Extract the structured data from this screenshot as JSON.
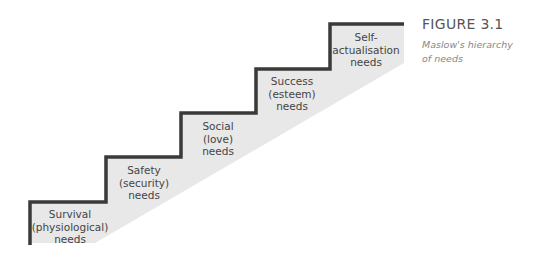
{
  "figure": {
    "title": "FIGURE 3.1",
    "caption_line1": "Maslow's hierarchy",
    "caption_line2": "of needs"
  },
  "steps": [
    {
      "lines": [
        "Survival",
        "(physiological)",
        "needs"
      ]
    },
    {
      "lines": [
        "Safety",
        "(security)",
        "needs"
      ]
    },
    {
      "lines": [
        "Social",
        "(love)",
        "needs"
      ]
    },
    {
      "lines": [
        "Success",
        "(esteem)",
        "needs"
      ]
    },
    {
      "lines": [
        "Self-",
        "actualisation",
        "needs"
      ]
    }
  ],
  "colors": {
    "stair_line": "#3a3a3a",
    "fill": "#e6e6e6"
  }
}
